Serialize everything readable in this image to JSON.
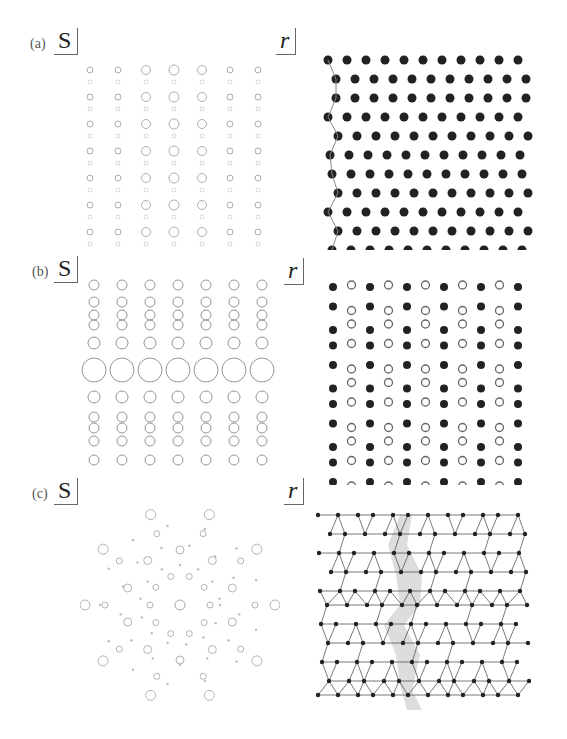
{
  "figure": {
    "panels": [
      {
        "id": "a",
        "label": "(a)",
        "left_symbol": "S",
        "right_symbol": "r",
        "left_description": "diffraction pattern of a modulated lattice (rows of satellite rings)",
        "right_description": "square lattice of black atoms with a wavy domain boundary on the left edge"
      },
      {
        "id": "b",
        "label": "(b)",
        "left_symbol": "S",
        "right_symbol": "r",
        "left_description": "diffraction pattern with a row of large rings in the center",
        "right_description": "alternating columns of filled and open circles"
      },
      {
        "id": "c",
        "label": "(c)",
        "left_symbol": "S",
        "right_symbol": "r",
        "left_description": "tenfold quasicrystalline diffraction pattern",
        "right_description": "Penrose-type rhombus tiling with a shaded phason strip"
      }
    ]
  }
}
